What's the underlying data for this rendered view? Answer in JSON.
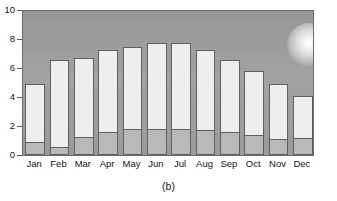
{
  "figure": {
    "caption": "(b)",
    "background_color": "#ffffff"
  },
  "colors": {
    "plot_background": "#9e9e9e",
    "bar_upper_fill": "#eeeeee",
    "bar_lower_fill": "#b9b9b9",
    "bar_outline": "#5f5f5f",
    "axis": "#6b6b6b",
    "text": "#111111",
    "sun_core": "#ffffff"
  },
  "decorations": [
    {
      "name": "sun-glow",
      "type": "radial-glow",
      "x_pct": 90.4,
      "y_pct": 23.3
    }
  ],
  "chart_data": {
    "type": "bar",
    "subtype": "stacked",
    "title": "",
    "xlabel": "",
    "ylabel": "",
    "categories": [
      "Jan",
      "Feb",
      "Mar",
      "Apr",
      "May",
      "Jun",
      "Jul",
      "Aug",
      "Sep",
      "Oct",
      "Nov",
      "Dec"
    ],
    "ylim": [
      0,
      10
    ],
    "yticks": [
      0,
      2,
      4,
      6,
      8,
      10
    ],
    "ytick_labels": [
      "0",
      "2",
      "4",
      "6",
      "8",
      "10"
    ],
    "grid": false,
    "legend": null,
    "series": [
      {
        "name": "lower-segment",
        "fill": "#b9b9b9",
        "values": [
          0.8,
          0.5,
          1.2,
          1.5,
          1.7,
          1.7,
          1.7,
          1.65,
          1.55,
          1.3,
          1.05,
          1.1
        ]
      },
      {
        "name": "upper-segment",
        "fill": "#eeeeee",
        "values": [
          4.0,
          5.95,
          5.4,
          5.7,
          5.7,
          5.95,
          5.95,
          5.55,
          4.95,
          4.4,
          3.75,
          2.9
        ]
      }
    ],
    "totals": [
      4.8,
      6.45,
      6.6,
      7.2,
      7.4,
      7.65,
      7.65,
      7.2,
      6.5,
      5.7,
      4.8,
      4.0
    ]
  }
}
